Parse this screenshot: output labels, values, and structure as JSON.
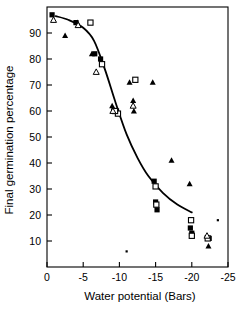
{
  "figure": {
    "background_color": "#ffffff",
    "ink_color": "#000000"
  },
  "axes": {
    "x_title": "Water potential (Bars)",
    "y_title": "Final germination percentage",
    "x_ticks": [
      "0",
      "-5",
      "-10",
      "-15",
      "-20",
      "-25"
    ],
    "y_ticks": [
      "90",
      "80",
      "70",
      "60",
      "50",
      "40",
      "30",
      "20",
      "10"
    ]
  },
  "chart_data": {
    "type": "scatter",
    "title": "",
    "xlabel": "Water potential (Bars)",
    "ylabel": "Final germination percentage",
    "xlim": [
      0,
      -25
    ],
    "ylim": [
      0,
      100
    ],
    "xticks": [
      0,
      -5,
      -10,
      -15,
      -20,
      -25
    ],
    "yticks": [
      10,
      20,
      30,
      40,
      50,
      60,
      70,
      80,
      90
    ],
    "grid": false,
    "legend": "none",
    "series": [
      {
        "name": "filled-square",
        "marker": "filled-square",
        "points": [
          {
            "x": -0.7,
            "y": 97
          },
          {
            "x": -4.0,
            "y": 94
          },
          {
            "x": -6.6,
            "y": 82
          },
          {
            "x": -7.4,
            "y": 80
          },
          {
            "x": -9.2,
            "y": 60
          },
          {
            "x": -9.6,
            "y": 60
          },
          {
            "x": -14.8,
            "y": 33
          },
          {
            "x": -15.0,
            "y": 25
          },
          {
            "x": -15.2,
            "y": 22
          },
          {
            "x": -19.8,
            "y": 15
          },
          {
            "x": -20.0,
            "y": 13
          },
          {
            "x": -22.4,
            "y": 11
          }
        ]
      },
      {
        "name": "open-square",
        "marker": "open-square",
        "points": [
          {
            "x": -6.0,
            "y": 94
          },
          {
            "x": -7.6,
            "y": 78
          },
          {
            "x": -9.8,
            "y": 59
          },
          {
            "x": -9.4,
            "y": 60
          },
          {
            "x": -12.2,
            "y": 72
          },
          {
            "x": -15.0,
            "y": 31
          },
          {
            "x": -15.1,
            "y": 24
          },
          {
            "x": -19.9,
            "y": 18
          },
          {
            "x": -20.0,
            "y": 12
          },
          {
            "x": -22.2,
            "y": 11
          }
        ]
      },
      {
        "name": "filled-triangle",
        "marker": "filled-triangle",
        "points": [
          {
            "x": -2.5,
            "y": 89
          },
          {
            "x": -4.2,
            "y": 94
          },
          {
            "x": -6.2,
            "y": 82
          },
          {
            "x": -9.0,
            "y": 62
          },
          {
            "x": -11.4,
            "y": 71
          },
          {
            "x": -11.9,
            "y": 64
          },
          {
            "x": -12.0,
            "y": 60
          },
          {
            "x": -14.6,
            "y": 71
          },
          {
            "x": -17.2,
            "y": 41
          },
          {
            "x": -19.7,
            "y": 32
          },
          {
            "x": -22.3,
            "y": 8
          }
        ]
      },
      {
        "name": "open-triangle",
        "marker": "open-triangle",
        "points": [
          {
            "x": -0.9,
            "y": 95
          },
          {
            "x": -4.3,
            "y": 93
          },
          {
            "x": -6.8,
            "y": 75
          },
          {
            "x": -9.1,
            "y": 60
          },
          {
            "x": -11.9,
            "y": 62
          },
          {
            "x": -22.1,
            "y": 12
          }
        ]
      },
      {
        "name": "small-dot",
        "marker": "small-dot",
        "points": [
          {
            "x": -11.0,
            "y": 6
          },
          {
            "x": -23.6,
            "y": 18
          }
        ]
      }
    ],
    "fitted_curve": {
      "description": "sigmoid fitted curve",
      "points": [
        {
          "x": -1.2,
          "y": 96.5
        },
        {
          "x": -3.0,
          "y": 95.0
        },
        {
          "x": -5.0,
          "y": 92.0
        },
        {
          "x": -6.5,
          "y": 87.0
        },
        {
          "x": -8.0,
          "y": 76.0
        },
        {
          "x": -9.5,
          "y": 63.0
        },
        {
          "x": -11.0,
          "y": 51.0
        },
        {
          "x": -12.5,
          "y": 42.0
        },
        {
          "x": -14.0,
          "y": 35.0
        },
        {
          "x": -16.0,
          "y": 28.5
        },
        {
          "x": -18.0,
          "y": 24.0
        },
        {
          "x": -20.0,
          "y": 21.0
        }
      ]
    }
  }
}
